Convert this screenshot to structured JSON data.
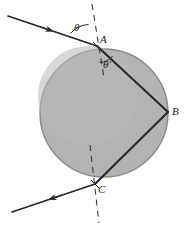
{
  "figure": {
    "colors": {
      "sphere_fill": "#b3b3b3",
      "sphere_stroke": "#8a8a8a",
      "ray": "#262626",
      "normal_dash": "#3a3a3a",
      "label": "#1a1a1a",
      "background": "#ffffff"
    },
    "sphere": {
      "name": "sphere",
      "center_x": 104,
      "center_y": 113,
      "radius": 64
    },
    "points": [
      {
        "id": "A",
        "label": "A",
        "x": 97,
        "y": 46,
        "role": "entry-refraction-point"
      },
      {
        "id": "B",
        "label": "B",
        "x": 168,
        "y": 112,
        "role": "internal-reflection-point"
      },
      {
        "id": "C",
        "label": "C",
        "x": 95,
        "y": 184,
        "role": "exit-refraction-point"
      }
    ],
    "angles": [
      {
        "id": "theta",
        "label": "θ",
        "at": "A",
        "meaning": "angle of incidence"
      },
      {
        "id": "theta-prime",
        "label": "θ′",
        "at": "A",
        "meaning": "angle of refraction"
      }
    ],
    "rays": [
      {
        "id": "incident",
        "from_x": 8,
        "from_y": 16,
        "to_x": 97,
        "to_y": 46,
        "arrow": "mid",
        "arrow_dir": "toward-sphere"
      },
      {
        "id": "internal-A-to-B",
        "from_x": 97,
        "from_y": 46,
        "to_x": 168,
        "to_y": 112,
        "arrow": "none"
      },
      {
        "id": "internal-B-to-C",
        "from_x": 168,
        "from_y": 112,
        "to_x": 95,
        "to_y": 184,
        "arrow": "none"
      },
      {
        "id": "emergent",
        "from_x": 95,
        "from_y": 184,
        "to_x": 12,
        "to_y": 212,
        "arrow": "mid",
        "arrow_dir": "away-from-sphere"
      }
    ],
    "normals": [
      {
        "id": "normal-at-A",
        "x1": 92,
        "y1": 4,
        "x2": 104,
        "y2": 78,
        "style": "dashed"
      },
      {
        "id": "normal-at-C",
        "x1": 90,
        "y1": 145,
        "x2": 99,
        "y2": 223,
        "style": "dashed"
      }
    ]
  }
}
